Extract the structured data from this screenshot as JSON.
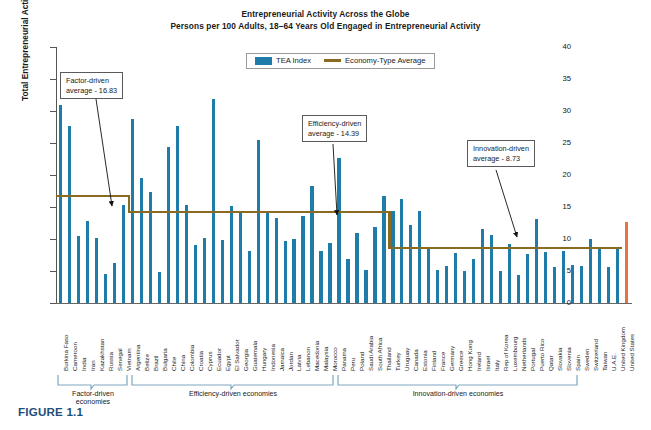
{
  "figure": {
    "caption": "FIGURE 1.1",
    "title": "Entrepreneurial Activity Across the Globe",
    "subtitle": "Persons per 100 Adults, 18–64 Years Old Engaged in Entrepreneurial Activity"
  },
  "legend": {
    "position": "top-center",
    "items": [
      {
        "label": "TEA Index",
        "marker": "bar",
        "color": "#1f7ca8"
      },
      {
        "label": "Economy-Type Average",
        "marker": "line",
        "color": "#8a6a20"
      }
    ]
  },
  "annotations": [
    {
      "name": "factor-driven-callout",
      "line1": "Factor-driven",
      "line2": "average - 16.83",
      "value": 16.83
    },
    {
      "name": "efficiency-driven-callout",
      "line1": "Efficiency-driven",
      "line2": "average - 14.39",
      "value": 14.39
    },
    {
      "name": "innovation-driven-callout",
      "line1": "Innovation-driven",
      "line2": "average - 8.73",
      "value": 8.73
    }
  ],
  "groups": [
    {
      "key": "factor",
      "label": "Factor-driven economies",
      "average": 16.83,
      "start": 0,
      "count": 8
    },
    {
      "key": "efficiency",
      "label": "Efficiency-driven economies",
      "average": 14.39,
      "start": 8,
      "count": 29
    },
    {
      "key": "innovation",
      "label": "Innovation-driven economies",
      "average": 8.73,
      "start": 37,
      "count": 26
    }
  ],
  "colors": {
    "bar": "#1f7ca8",
    "highlight_bar": "#e8743b",
    "average_line": "#8a6a20",
    "caption": "#1f4e79",
    "bracket": "#7fa8c0"
  },
  "chart_data": {
    "type": "bar",
    "title": "Entrepreneurial Activity Across the Globe",
    "subtitle": "Persons per 100 Adults, 18–64 Years Old Engaged in Entrepreneurial Activity",
    "xlabel": "",
    "ylabel": "Total Entrepreneurial Activity (TEA) Index",
    "ylim": [
      0,
      40
    ],
    "yticks": [
      0,
      5,
      10,
      15,
      20,
      25,
      30,
      35,
      40
    ],
    "grid": false,
    "legend_position": "top-center",
    "highlight": {
      "category": "United States",
      "value": 12.7,
      "color": "#e8743b"
    },
    "series": [
      {
        "name": "TEA Index",
        "color": "#1f7ca8",
        "values": [
          31.0,
          27.6,
          10.5,
          12.8,
          10.1,
          4.6,
          6.2,
          15.3,
          28.8,
          19.5,
          17.3,
          4.9,
          24.3,
          27.6,
          15.3,
          9.0,
          10.2,
          31.9,
          9.8,
          15.1,
          14.3,
          8.1,
          25.5,
          14.1,
          13.3,
          9.7,
          10.0,
          13.6,
          18.3,
          8.2,
          9.4,
          22.7,
          6.8,
          11.0,
          5.1,
          11.9,
          16.7,
          14.4,
          16.3,
          12.2,
          14.3,
          8.8,
          5.2,
          5.8,
          7.8,
          5.0,
          6.8,
          11.6,
          10.6,
          5.0,
          9.2,
          4.3,
          7.6,
          13.1,
          8.0,
          5.7,
          8.2,
          6.0,
          5.8,
          10.0,
          8.8,
          5.7,
          8.8,
          12.7
        ]
      }
    ],
    "categories": [
      "Burkina Faso",
      "Cameroon",
      "India",
      "Iran",
      "Kazakhstan",
      "Russia",
      "Senegal",
      "Vietnam",
      "Argentina",
      "Belize",
      "Brazil",
      "Bulgaria",
      "Chile",
      "China",
      "Colombia",
      "Croatia",
      "Cyprus",
      "Ecuador",
      "Egypt",
      "El Salvador",
      "Georgia",
      "Guatemala",
      "Hungary",
      "Indonesia",
      "Jamaica",
      "Jordan",
      "Latvia",
      "Lebanon",
      "Macedonia",
      "Malaysia",
      "Morocco",
      "Panama",
      "Peru",
      "Poland",
      "Saudi Arabia",
      "South Africa",
      "Thailand",
      "Turkey",
      "Uruguay",
      "Canada",
      "Estonia",
      "Finland",
      "France",
      "Germany",
      "Greece",
      "Hong Kong",
      "Ireland",
      "Israel",
      "Italy",
      "Rep of Korea",
      "Luxembourg",
      "Netherlands",
      "Portugal",
      "Puerto Rico",
      "Qatar",
      "Slovakia",
      "Slovenia",
      "Spain",
      "Sweden",
      "Switzerland",
      "Taiwan",
      "U.A.E.",
      "United Kingdom",
      "United States"
    ]
  }
}
